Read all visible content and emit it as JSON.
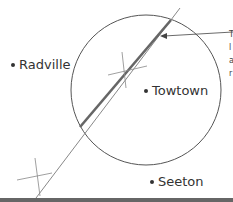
{
  "places": [
    {
      "name": "Radville",
      "x": 13,
      "y": 65
    },
    {
      "name": "Towtown",
      "x": 146,
      "y": 91
    },
    {
      "name": "Seeton",
      "x": 152,
      "y": 182
    }
  ],
  "circle": {
    "cx": 146,
    "cy": 90,
    "r": 75,
    "stroke": "#555555"
  },
  "bisector_line": {
    "x1": 38,
    "y1": 196,
    "x2": 180,
    "y2": 8,
    "stroke": "#888888"
  },
  "highlight_segment": {
    "x1": 80,
    "y1": 127,
    "x2": 171,
    "y2": 20,
    "stroke": "#666666"
  },
  "construction_marks": [
    {
      "x": 125,
      "y": 70
    },
    {
      "x": 38,
      "y": 177
    }
  ],
  "arrow": {
    "x1": 233,
    "y1": 32,
    "x2": 161,
    "y2": 36
  },
  "cut_off_annotation_fragments": [
    "T",
    "l",
    "a",
    "r"
  ]
}
